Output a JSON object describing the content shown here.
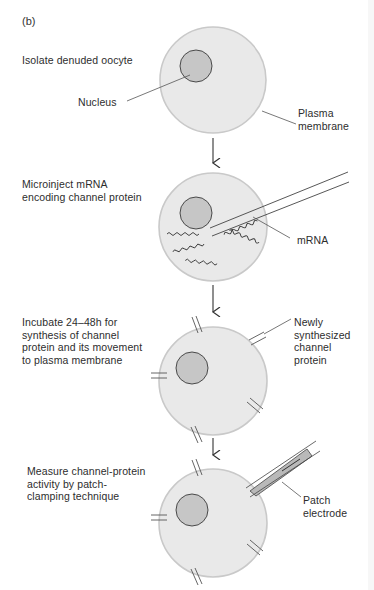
{
  "figure": {
    "panel_label": "(b)",
    "colors": {
      "cell_fill": "#e8e8e8",
      "cell_stroke": "#c8c8c8",
      "nucleus_fill": "#c4c4c4",
      "nucleus_stroke": "#3a3a3a",
      "line": "#555555",
      "text": "#2d2d2d",
      "electrode_fill": "#b8b8b8"
    },
    "steps": [
      {
        "instruction": "Isolate denuded oocyte",
        "labels": [
          "Nucleus",
          "Plasma\nmembrane"
        ]
      },
      {
        "instruction": "Microinject mRNA\nencoding channel protein",
        "labels": [
          "mRNA"
        ]
      },
      {
        "instruction": "Incubate 24–48h for\nsynthesis of channel\nprotein and its movement\nto plasma membrane",
        "labels": [
          "Newly\nsynthesized\nchannel\nprotein"
        ]
      },
      {
        "instruction": "Measure channel-protein\nactivity by patch-\nclamping technique",
        "labels": [
          "Patch\nelectrode"
        ]
      }
    ],
    "arrows": [
      {
        "from_step": 1,
        "to_step": 2,
        "symbol": "down-arrow"
      },
      {
        "from_step": 2,
        "to_step": 3,
        "symbol": "down-arrow"
      },
      {
        "from_step": 3,
        "to_step": 4,
        "symbol": "down-arrow"
      }
    ]
  }
}
